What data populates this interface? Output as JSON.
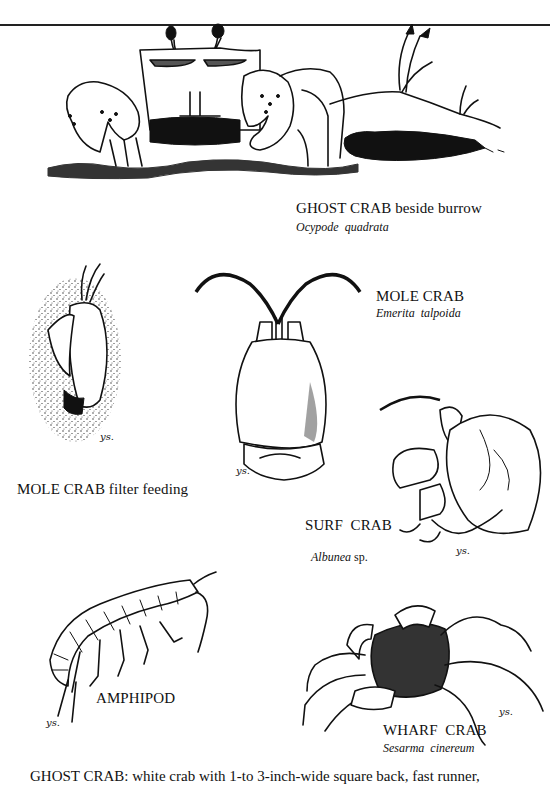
{
  "page": {
    "type": "field guide illustration plate",
    "rule_color": "#222222",
    "ink_color": "#111111",
    "background": "#ffffff"
  },
  "figures": [
    {
      "id": "ghost-crab",
      "label": "GHOST CRAB beside burrow",
      "scientific_name": "Ocypode  quadrata"
    },
    {
      "id": "mole-crab",
      "label": "MOLE CRAB",
      "scientific_name": "Emerita  talpoida"
    },
    {
      "id": "mole-crab-feeding",
      "label": "MOLE CRAB filter feeding",
      "scientific_name": ""
    },
    {
      "id": "surf-crab",
      "label": "SURF  CRAB",
      "scientific_name": "Albunea",
      "scientific_suffix": " sp."
    },
    {
      "id": "amphipod",
      "label": "AMPHIPOD",
      "scientific_name": ""
    },
    {
      "id": "wharf-crab",
      "label": "WHARF  CRAB",
      "scientific_name": "Sesarma  cinereum"
    }
  ],
  "artist_signature": "ys.",
  "caption": {
    "text": "GHOST CRAB: white crab with 1-to 3-inch-wide square back, fast runner,"
  }
}
